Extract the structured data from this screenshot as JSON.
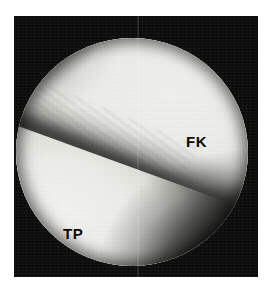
{
  "figure": {
    "kind": "radiograph",
    "modality": "fluoroscopic knee radiograph",
    "view": "circular field of view",
    "background_color": "#ffffff",
    "frame_color": "#0b0b0b",
    "field_base_color": "#eeeeea"
  },
  "labels": {
    "femur": {
      "text": "FK",
      "meaning": "femoral condyle",
      "color": "#0a0a0a",
      "x": 172,
      "y": 118
    },
    "tibia": {
      "text": "TP",
      "meaning": "tibial plateau",
      "color": "#0a0a0a",
      "x": 49,
      "y": 210
    }
  },
  "frame": {
    "x": 14,
    "y": 16,
    "width": 244,
    "height": 261
  },
  "field_of_view": {
    "center_x": 132,
    "center_y": 152,
    "diameter": 232
  },
  "artifacts": {
    "scan_seam_x": 137
  }
}
